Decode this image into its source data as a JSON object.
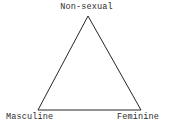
{
  "diagram": {
    "type": "triangle-model",
    "background_color": "#ffffff",
    "stroke_color": "#262626",
    "stroke_width": 1,
    "fill": "none",
    "text_color": "#2b2b2b",
    "vertices": [
      {
        "id": "apex",
        "label": "Non-sexual",
        "x": 88,
        "y": 16
      },
      {
        "id": "bottom-left",
        "label": "Masculine",
        "x": 38,
        "y": 110
      },
      {
        "id": "bottom-right",
        "label": "Feminine",
        "x": 141,
        "y": 110
      }
    ],
    "labels": {
      "apex": "Non-sexual",
      "bottom_left": "Masculine",
      "bottom_right": "Feminine"
    },
    "polygon_points": "88,16 38,110 141,110"
  }
}
